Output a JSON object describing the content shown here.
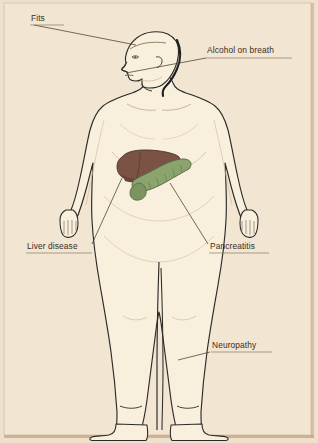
{
  "figure": {
    "background_color": "#efe0cc",
    "frame_color": "#c9a98c",
    "panel_color": "#f3e6d3",
    "outline_color": "#2b2b2b",
    "body_fill": "#f8f0dd",
    "leader_line_color": "#4a3c2e",
    "label_text_color": "#3a2d22"
  },
  "organs": [
    {
      "name": "liver",
      "label": "Liver",
      "color": "#7b5344",
      "shade": "#6a4436",
      "position": "upper-right-abdomen"
    },
    {
      "name": "pancreas",
      "label": "Pancreas",
      "color": "#87a06a",
      "shade": "#6f8a52",
      "position": "mid-abdomen-left"
    }
  ],
  "labels": [
    {
      "id": "fits",
      "text": "Fits",
      "x": 31,
      "y": 14,
      "underline_width": 34,
      "points_to": "head"
    },
    {
      "id": "alcohol-on-breath",
      "text": "Alcohol on breath",
      "x": 207,
      "y": 52,
      "underline_width": 84,
      "points_to": "mouth"
    },
    {
      "id": "liver-disease",
      "text": "Liver disease",
      "x": 27,
      "y": 247,
      "underline_width": 64,
      "points_to": "liver"
    },
    {
      "id": "pancreatitis",
      "text": "Pancreatitis",
      "x": 210,
      "y": 247,
      "underline_width": 58,
      "points_to": "pancreas"
    },
    {
      "id": "neuropathy",
      "text": "Neuropathy",
      "x": 212,
      "y": 345,
      "underline_width": 58,
      "points_to": "lower-leg"
    }
  ]
}
